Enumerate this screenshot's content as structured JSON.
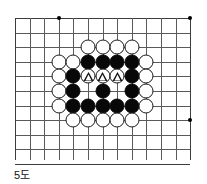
{
  "figure": {
    "caption": "5도",
    "kind": "go-board-diagram"
  },
  "board": {
    "columns": 12,
    "rows": 10,
    "cell_px": 14.6,
    "line_color": "#5a5a5a",
    "edge_color": "#3c3c3c",
    "background": "#ffffff",
    "star_points": [
      {
        "col": 3,
        "row": 0
      },
      {
        "col": 12,
        "row": 0
      },
      {
        "col": 12,
        "row": 7
      }
    ],
    "stones": [
      {
        "col": 5,
        "row": 2,
        "color": "white",
        "mark": "none"
      },
      {
        "col": 6,
        "row": 2,
        "color": "white",
        "mark": "none"
      },
      {
        "col": 7,
        "row": 2,
        "color": "white",
        "mark": "none"
      },
      {
        "col": 8,
        "row": 2,
        "color": "white",
        "mark": "none"
      },
      {
        "col": 3,
        "row": 3,
        "color": "white",
        "mark": "none"
      },
      {
        "col": 4,
        "row": 3,
        "color": "white",
        "mark": "none"
      },
      {
        "col": 5,
        "row": 3,
        "color": "black",
        "mark": "none"
      },
      {
        "col": 6,
        "row": 3,
        "color": "black",
        "mark": "none"
      },
      {
        "col": 7,
        "row": 3,
        "color": "black",
        "mark": "none"
      },
      {
        "col": 8,
        "row": 3,
        "color": "black",
        "mark": "none"
      },
      {
        "col": 9,
        "row": 3,
        "color": "white",
        "mark": "none"
      },
      {
        "col": 3,
        "row": 4,
        "color": "white",
        "mark": "none"
      },
      {
        "col": 4,
        "row": 4,
        "color": "black",
        "mark": "none"
      },
      {
        "col": 5,
        "row": 4,
        "color": "white",
        "mark": "triangle"
      },
      {
        "col": 6,
        "row": 4,
        "color": "white",
        "mark": "triangle"
      },
      {
        "col": 7,
        "row": 4,
        "color": "white",
        "mark": "triangle"
      },
      {
        "col": 8,
        "row": 4,
        "color": "black",
        "mark": "none"
      },
      {
        "col": 9,
        "row": 4,
        "color": "white",
        "mark": "none"
      },
      {
        "col": 3,
        "row": 5,
        "color": "white",
        "mark": "none"
      },
      {
        "col": 4,
        "row": 5,
        "color": "black",
        "mark": "none"
      },
      {
        "col": 6,
        "row": 5,
        "color": "black",
        "mark": "none"
      },
      {
        "col": 8,
        "row": 5,
        "color": "black",
        "mark": "none"
      },
      {
        "col": 9,
        "row": 5,
        "color": "white",
        "mark": "none"
      },
      {
        "col": 3,
        "row": 6,
        "color": "white",
        "mark": "none"
      },
      {
        "col": 4,
        "row": 6,
        "color": "black",
        "mark": "none"
      },
      {
        "col": 5,
        "row": 6,
        "color": "black",
        "mark": "none"
      },
      {
        "col": 6,
        "row": 6,
        "color": "black",
        "mark": "none"
      },
      {
        "col": 7,
        "row": 6,
        "color": "black",
        "mark": "none"
      },
      {
        "col": 8,
        "row": 6,
        "color": "black",
        "mark": "none"
      },
      {
        "col": 9,
        "row": 6,
        "color": "white",
        "mark": "none"
      },
      {
        "col": 4,
        "row": 7,
        "color": "white",
        "mark": "none"
      },
      {
        "col": 5,
        "row": 7,
        "color": "white",
        "mark": "none"
      },
      {
        "col": 6,
        "row": 7,
        "color": "white",
        "mark": "none"
      },
      {
        "col": 7,
        "row": 7,
        "color": "white",
        "mark": "none"
      },
      {
        "col": 8,
        "row": 7,
        "color": "white",
        "mark": "none"
      }
    ]
  }
}
